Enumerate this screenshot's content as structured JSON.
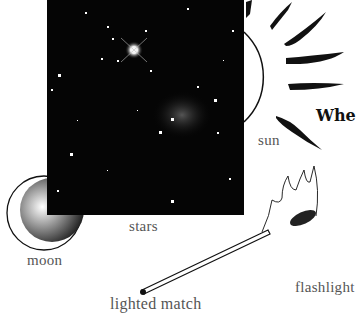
{
  "page": {
    "heading_fragment": "Whe",
    "illustrations": [
      {
        "id": "stars",
        "label": "stars",
        "kind": "photograph"
      },
      {
        "id": "sun",
        "label": "sun",
        "kind": "drawing"
      },
      {
        "id": "moon",
        "label": "moon",
        "kind": "drawing"
      },
      {
        "id": "match",
        "label": "lighted match",
        "kind": "drawing"
      },
      {
        "id": "flashlight",
        "label": "flashlight",
        "kind": "label-only"
      }
    ]
  },
  "colors": {
    "ink": "#111111",
    "label": "#555555",
    "photo_bg": "#050505"
  }
}
